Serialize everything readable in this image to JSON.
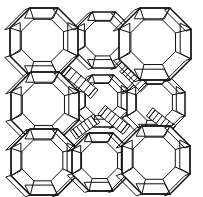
{
  "figure": {
    "background_color": "#ffffff",
    "line_color": "#111111",
    "width": 203,
    "height": 197,
    "structure_type": "zeolite-framework-diagram",
    "cage_shape": "truncated-octahedron",
    "linker_shape": "hexagonal-prism"
  },
  "chart_data": {
    "type": "diagram",
    "grid": {
      "columns": 3,
      "rows": 3
    },
    "cages": [
      {
        "id": "cage-r1c1",
        "cx": 44,
        "cy": 42,
        "r": 34,
        "depth": 9,
        "style": "front"
      },
      {
        "id": "cage-r1c2",
        "cx": 104,
        "cy": 40,
        "r": 28,
        "depth": 8,
        "style": "back"
      },
      {
        "id": "cage-r1c3",
        "cx": 155,
        "cy": 44,
        "r": 36,
        "depth": 10,
        "style": "front"
      },
      {
        "id": "cage-r2c1",
        "cx": 45,
        "cy": 106,
        "r": 34,
        "depth": 9,
        "style": "front"
      },
      {
        "id": "cage-r2c2",
        "cx": 103,
        "cy": 101,
        "r": 26,
        "depth": 8,
        "style": "back"
      },
      {
        "id": "cage-r2c3",
        "cx": 156,
        "cy": 104,
        "r": 29,
        "depth": 9,
        "style": "back"
      },
      {
        "id": "cage-r3c1",
        "cx": 44,
        "cy": 162,
        "r": 33,
        "depth": 9,
        "style": "front"
      },
      {
        "id": "cage-r3c2",
        "cx": 101,
        "cy": 162,
        "r": 29,
        "depth": 8,
        "style": "front"
      },
      {
        "id": "cage-r3c3",
        "cx": 156,
        "cy": 160,
        "r": 34,
        "depth": 10,
        "style": "front"
      }
    ],
    "prisms": [
      {
        "id": "prism-a",
        "x1": 68,
        "y1": 72,
        "x2": 92,
        "y2": 92,
        "w": 11
      },
      {
        "id": "prism-b",
        "x1": 126,
        "y1": 70,
        "x2": 142,
        "y2": 86,
        "w": 10
      },
      {
        "id": "prism-c",
        "x1": 124,
        "y1": 128,
        "x2": 104,
        "y2": 112,
        "w": 11
      },
      {
        "id": "prism-d",
        "x1": 76,
        "y1": 133,
        "x2": 94,
        "y2": 120,
        "w": 10
      },
      {
        "id": "prism-e",
        "x1": 170,
        "y1": 128,
        "x2": 152,
        "y2": 114,
        "w": 10
      }
    ],
    "axis_labels": [],
    "legend": [],
    "annotations": []
  }
}
